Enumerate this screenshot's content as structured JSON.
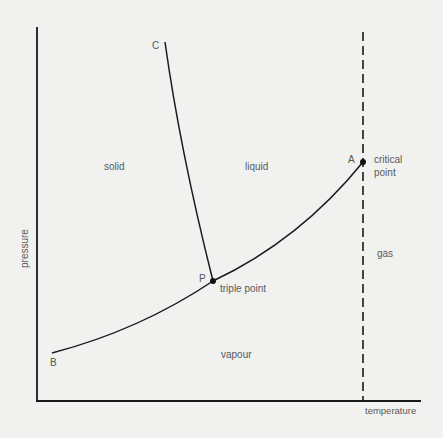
{
  "diagram": {
    "type": "phase-diagram",
    "axes": {
      "x_label": "temperature",
      "y_label": "pressure"
    },
    "regions": {
      "solid": "solid",
      "liquid": "liquid",
      "gas": "gas",
      "vapour": "vapour"
    },
    "points": {
      "A": "A",
      "B": "B",
      "C": "C",
      "P": "P"
    },
    "annotations": {
      "critical_point_line1": "critical",
      "critical_point_line2": "point",
      "triple_point": "triple point"
    },
    "curves": [
      {
        "name": "fusion-curve",
        "from": "P",
        "to": "C"
      },
      {
        "name": "sublimation-curve",
        "from": "B",
        "to": "P"
      },
      {
        "name": "vaporisation-curve",
        "from": "P",
        "to": "A"
      },
      {
        "name": "critical-temperature-line",
        "style": "dashed",
        "through": "A"
      }
    ],
    "colors": {
      "line": "#1a1a1a",
      "text": "#5a5a5a",
      "background": "#f1f1f0"
    }
  }
}
